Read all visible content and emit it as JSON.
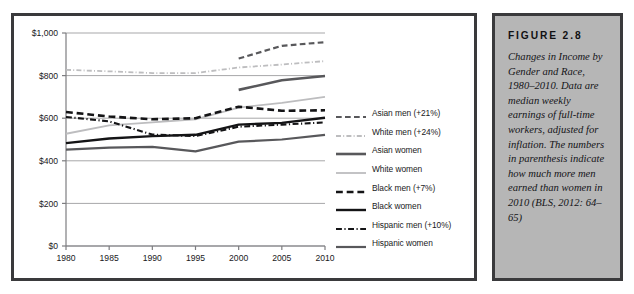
{
  "figure": {
    "title": "FIGURE 2.8",
    "caption": "Changes in Income by Gender and Race, 1980–2010. Data are median weekly earnings of full-time workers, adjusted for inflation. The numbers in parenthesis indicate how much more men earned than women in 2010 (BLS, 2012: 64–65)"
  },
  "colors": {
    "frame": "#3a3a3c",
    "caption_background": "#b6b6b6",
    "plot_background": "#ffffff",
    "gridline": "#a7a7a9",
    "axis": "#7d7d80",
    "black_series": "#141416",
    "dark_gray_series": "#58585b",
    "light_gray_series": "#bdbdbf",
    "mid_gray_series": "#8c8c8f",
    "tick_label": "#19191b"
  },
  "chart_data": {
    "type": "line",
    "title": "",
    "xlabel": "",
    "ylabel": "",
    "x": [
      1980,
      1985,
      1990,
      1995,
      2000,
      2005,
      2010
    ],
    "xlim": [
      1980,
      2010
    ],
    "ylim": [
      0,
      1000
    ],
    "y_ticks": [
      0,
      200,
      400,
      600,
      800,
      1000
    ],
    "y_tick_labels": [
      "$0",
      "$200",
      "$400",
      "$600",
      "$800",
      "$1,000"
    ],
    "x_tick_labels": [
      "1980",
      "1985",
      "1990",
      "1995",
      "2000",
      "2005",
      "2010"
    ],
    "grid": true,
    "legend_position": "right-inside",
    "series": [
      {
        "name": "Asian men (+21%)",
        "label": "Asian men (+21%)",
        "style": "dashed",
        "color": "#58585b",
        "width": 2.2,
        "x": [
          2000,
          2005,
          2010
        ],
        "values": [
          880,
          940,
          957
        ]
      },
      {
        "name": "White men (+24%)",
        "label": "White men (+24%)",
        "style": "dash-dot",
        "color": "#bdbdbf",
        "width": 1.8,
        "x": [
          1980,
          1985,
          1990,
          1995,
          2000,
          2005,
          2010
        ],
        "values": [
          827,
          820,
          812,
          812,
          838,
          852,
          868
        ]
      },
      {
        "name": "Asian women",
        "label": "Asian women",
        "style": "solid",
        "color": "#58585b",
        "width": 2.6,
        "x": [
          2000,
          2005,
          2010
        ],
        "values": [
          733,
          778,
          798
        ]
      },
      {
        "name": "White women",
        "label": "White women",
        "style": "solid",
        "color": "#bdbdbf",
        "width": 1.8,
        "x": [
          1980,
          1985,
          1990,
          1995,
          2000,
          2005,
          2010
        ],
        "values": [
          527,
          566,
          580,
          595,
          650,
          672,
          700
        ]
      },
      {
        "name": "Black men (+7%)",
        "label": "Black men (+7%)",
        "style": "dashed",
        "color": "#141416",
        "width": 2.6,
        "x": [
          1980,
          1985,
          1990,
          1995,
          2000,
          2005,
          2010
        ],
        "values": [
          629,
          608,
          595,
          600,
          654,
          635,
          637
        ]
      },
      {
        "name": "Black women",
        "label": "Black women",
        "style": "solid",
        "color": "#141416",
        "width": 2.4,
        "x": [
          1980,
          1985,
          1990,
          1995,
          2000,
          2005,
          2010
        ],
        "values": [
          483,
          505,
          516,
          522,
          570,
          578,
          602
        ]
      },
      {
        "name": "Hispanic men (+10%)",
        "label": "Hispanic men (+10%)",
        "style": "dash-dot",
        "color": "#141416",
        "width": 2.1,
        "x": [
          1980,
          1985,
          1990,
          1995,
          2000,
          2005,
          2010
        ],
        "values": [
          606,
          585,
          523,
          516,
          560,
          570,
          580
        ]
      },
      {
        "name": "Hispanic women",
        "label": "Hispanic women",
        "style": "solid",
        "color": "#58585b",
        "width": 2.2,
        "x": [
          1980,
          1985,
          1990,
          1995,
          2000,
          2005,
          2010
        ],
        "values": [
          452,
          462,
          465,
          444,
          490,
          500,
          522
        ]
      }
    ]
  }
}
